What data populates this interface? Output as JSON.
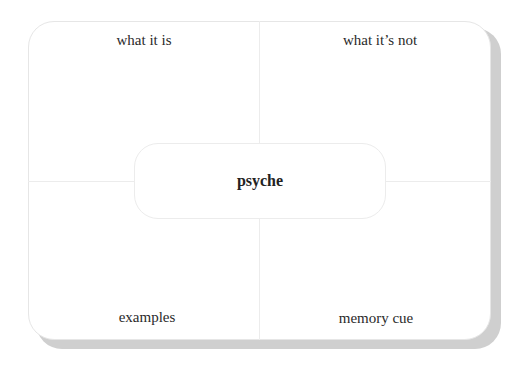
{
  "diagram": {
    "type": "frayer-model",
    "center_term": "psyche",
    "quadrants": {
      "top_left": "what it is",
      "top_right": "what it’s not",
      "bottom_left": "examples",
      "bottom_right": "memory cue"
    }
  }
}
